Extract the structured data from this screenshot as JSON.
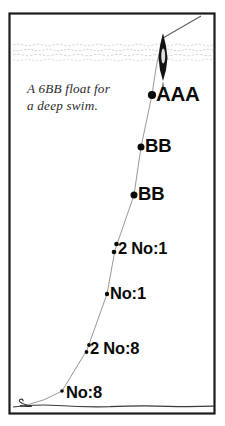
{
  "figure": {
    "type": "fishing-float-shotting-diagram",
    "frame": {
      "color": "#1c1c1c"
    },
    "background_color": "#ffffff"
  },
  "caption": {
    "line1": "A 6BB float for",
    "line2": "a deep swim.",
    "color": "#2a2a2a"
  },
  "water": {
    "surface_label": "water-surface-lines",
    "line_color": "#b9bcc0",
    "riverbed_label": "riverbed-line",
    "riverbed_color": "#3a3a3a"
  },
  "float": {
    "name": "6BB float",
    "body_color": "#111111",
    "highlight_color": "#f2f2f2"
  },
  "line": {
    "name": "fishing-line",
    "color": "#7a7a7a"
  },
  "shots": [
    {
      "id": "aaa",
      "label": "AAA",
      "count": 1,
      "size": "AAA",
      "x": 152,
      "y": 95
    },
    {
      "id": "bb1",
      "label": "BB",
      "count": 1,
      "size": "BB",
      "x": 141,
      "y": 147
    },
    {
      "id": "bb2",
      "label": "BB",
      "count": 1,
      "size": "BB",
      "x": 134,
      "y": 195
    },
    {
      "id": "no1b",
      "label": "2 No:1",
      "count": 2,
      "size": "No:1",
      "x": 115,
      "y": 250
    },
    {
      "id": "no1a",
      "label": "No:1",
      "count": 1,
      "size": "No:1",
      "x": 107,
      "y": 294
    },
    {
      "id": "no8b",
      "label": "2 No:8",
      "count": 2,
      "size": "No:8",
      "x": 87,
      "y": 350
    },
    {
      "id": "no8a",
      "label": "No:8",
      "count": 1,
      "size": "No:8",
      "x": 62,
      "y": 391
    }
  ],
  "hook": {
    "label": "hook-and-bait",
    "color": "#2b2b2b"
  }
}
